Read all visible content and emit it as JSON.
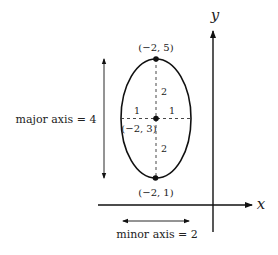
{
  "diagram": {
    "axes": {
      "x_label": "x",
      "y_label": "y"
    },
    "points": {
      "top": {
        "label": "(−2, 5)"
      },
      "center": {
        "label": "(−2, 3)"
      },
      "bottom": {
        "label": "(−2, 1)"
      }
    },
    "segments": {
      "upper_semi_major": "2",
      "lower_semi_major": "2",
      "left_semi_minor": "1",
      "right_semi_minor": "1"
    },
    "annotations": {
      "major_axis": "major axis = 4",
      "minor_axis": "minor axis = 2"
    },
    "colors": {
      "stroke": "#111111",
      "background": "#ffffff"
    }
  }
}
